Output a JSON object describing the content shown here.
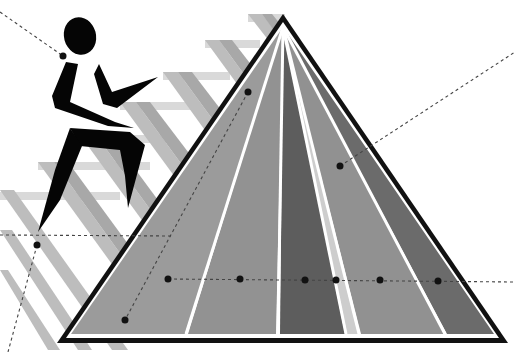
{
  "illustration": {
    "subject": "food-guide-pyramid-with-stair-climber",
    "colors": {
      "background": "#ffffff",
      "stairs": "#c4c4c4",
      "stairs_shadow": "#aaaaaa",
      "outline": "#111111",
      "figure": "#050505",
      "stripe_lines": "#ffffff",
      "callout_line": "#444444",
      "callout_dot": "#111111",
      "bands": [
        "#9a9a9a",
        "#8f8f8f",
        "#5c5c5c",
        "#c9c9c9",
        "#909090",
        "#6a6a6a"
      ]
    },
    "pyramid": {
      "apex": [
        283,
        16
      ],
      "base_left": [
        60,
        340
      ],
      "base_right": [
        505,
        340
      ]
    },
    "callouts": [
      {
        "dot": [
          63,
          56
        ],
        "to": [
          0,
          22
        ]
      },
      {
        "dot": [
          248,
          92
        ],
        "to": [
          125,
          320
        ]
      },
      {
        "dot": [
          340,
          166
        ],
        "to": [
          515,
          52
        ]
      },
      {
        "dot": [
          37,
          245
        ],
        "to": [
          8,
          352
        ]
      },
      {
        "dot": [
          168,
          279
        ],
        "to": [
          515,
          282
        ]
      }
    ],
    "row_dots": [
      [
        168,
        279
      ],
      [
        240,
        279
      ],
      [
        305,
        279
      ],
      [
        336,
        279
      ],
      [
        380,
        280
      ],
      [
        438,
        280
      ]
    ]
  }
}
